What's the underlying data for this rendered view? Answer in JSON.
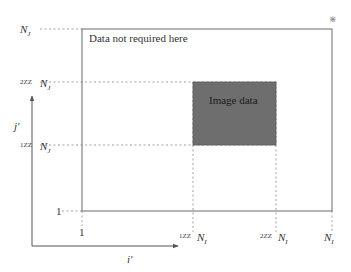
{
  "diagram": {
    "type": "region-of-interest",
    "colors": {
      "line": "#6b6b6b",
      "dash": "#8a8a8a",
      "image_block": "#6e6e6e",
      "text": "#333333"
    },
    "outer_region": {
      "label": "Data not required here"
    },
    "image_region": {
      "label": "Image data"
    },
    "axes": {
      "x_label": "i′",
      "y_label": "j′"
    },
    "y_ticks": [
      {
        "prefix": "",
        "label": "1"
      },
      {
        "prefix": "1ZZ",
        "label": "N",
        "sub": "J"
      },
      {
        "prefix": "2ZZ",
        "label": "N",
        "sub": "J"
      },
      {
        "prefix": "",
        "label": "N",
        "sub": "J"
      }
    ],
    "x_ticks": [
      {
        "prefix": "",
        "label": "1"
      },
      {
        "prefix": "1ZZ",
        "label": "N",
        "sub": "I"
      },
      {
        "prefix": "2ZZ",
        "label": "N",
        "sub": "I"
      },
      {
        "prefix": "",
        "label": "N",
        "sub": "I"
      }
    ],
    "corner_mark": "༕"
  }
}
